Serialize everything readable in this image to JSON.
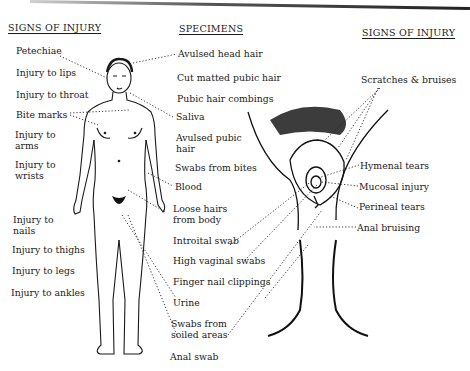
{
  "left_column": {
    "heading": "SIGNS OF INJURY",
    "items": [
      {
        "label": "Petechiae"
      },
      {
        "label": "Injury to lips"
      },
      {
        "label": "Injury to throat"
      },
      {
        "label": "Bite marks"
      },
      {
        "label": "Injury to",
        "label2": "arms"
      },
      {
        "label": "Injury to",
        "label2": "wrists"
      },
      {
        "label": "Injury to",
        "label2": "nails"
      },
      {
        "label": "Injury to thighs"
      },
      {
        "label": "Injury to legs"
      },
      {
        "label": "Injury to ankles"
      }
    ]
  },
  "center_column": {
    "heading": "SPECIMENS",
    "items": [
      {
        "label": "Avulsed head hair"
      },
      {
        "label": "Cut matted pubic hair"
      },
      {
        "label": "Pubic hair combings"
      },
      {
        "label": "Saliva"
      },
      {
        "label": "Avulsed pubic",
        "label2": "hair"
      },
      {
        "label": "Swabs from bites"
      },
      {
        "label": "Blood"
      },
      {
        "label": "Loose hairs",
        "label2": "from body"
      },
      {
        "label": "Introital swab"
      },
      {
        "label": "High vaginal swabs"
      },
      {
        "label": "Finger nail clippings"
      },
      {
        "label": "Urine"
      },
      {
        "label": "Swabs from",
        "label2": "soiled areas"
      },
      {
        "label": "Anal swab"
      }
    ]
  },
  "right_column": {
    "heading": "SIGNS OF INJURY",
    "items": [
      {
        "label": "Scratches & bruises"
      },
      {
        "label": "Hymenal tears"
      },
      {
        "label": "Mucosal injury"
      },
      {
        "label": "Perineal tears"
      },
      {
        "label": "Anal bruising"
      }
    ]
  },
  "illustrations": {
    "full_body": "female-figure-front",
    "close_up": "perineal-region"
  }
}
